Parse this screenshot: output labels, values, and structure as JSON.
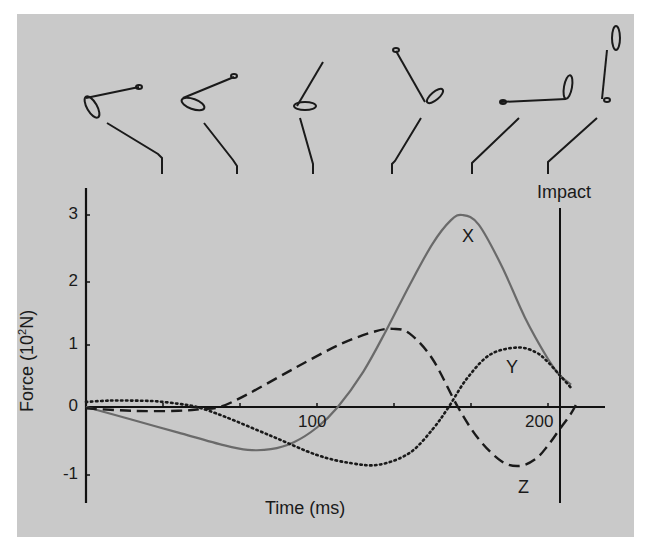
{
  "chart_data": {
    "type": "line",
    "title": "",
    "xlabel": "Time (ms)",
    "ylabel": "Force (10^2 N)",
    "ylabel_parts": {
      "prefix": "Force (10",
      "sup": "2",
      "suffix": "N)"
    },
    "xlim": [
      0,
      225
    ],
    "ylim": [
      -1.4,
      3.4
    ],
    "x_tick_labels": [
      {
        "value": 100,
        "label": "100"
      },
      {
        "value": 200,
        "label": "200"
      }
    ],
    "x_minor_ticks": [
      33,
      67,
      100,
      133,
      167,
      200
    ],
    "y_ticks": [
      {
        "value": 3,
        "label": "3"
      },
      {
        "value": 2,
        "label": "2"
      },
      {
        "value": 1,
        "label": "1"
      },
      {
        "value": 0,
        "label": "0"
      },
      {
        "value": -1,
        "label": "-1"
      }
    ],
    "grid": false,
    "legend": "inline labels",
    "annotations": [
      {
        "text": "Impact",
        "x": 205,
        "type": "vertical-line"
      },
      {
        "text": "X",
        "x": 163,
        "y": 2.7
      },
      {
        "text": "Y",
        "x": 185,
        "y": 0.6
      },
      {
        "text": "Z",
        "x": 188,
        "y": -1.3
      }
    ],
    "series": [
      {
        "name": "X",
        "style": "solid",
        "color": "#6a6a6a",
        "x": [
          0,
          20,
          40,
          60,
          70,
          80,
          90,
          100,
          109,
          120,
          130,
          140,
          150,
          158,
          163,
          170,
          180,
          190,
          200,
          205,
          210
        ],
        "y": [
          0,
          -0.2,
          -0.4,
          -0.6,
          -0.67,
          -0.66,
          -0.55,
          -0.32,
          0,
          0.55,
          1.2,
          1.9,
          2.55,
          2.92,
          3.0,
          2.85,
          2.2,
          1.4,
          0.75,
          0.5,
          0.35
        ]
      },
      {
        "name": "Y",
        "style": "dotted",
        "color": "#1a1a1a",
        "x": [
          0,
          10,
          20,
          30,
          40,
          48,
          60,
          80,
          100,
          115,
          127,
          140,
          150,
          157,
          165,
          175,
          187,
          195,
          200,
          205,
          210
        ],
        "y": [
          0.08,
          0.1,
          0.1,
          0.09,
          0.05,
          0,
          -0.15,
          -0.45,
          -0.75,
          -0.88,
          -0.9,
          -0.72,
          -0.35,
          0,
          0.45,
          0.82,
          0.93,
          0.85,
          0.7,
          0.5,
          0.3
        ]
      },
      {
        "name": "Z",
        "style": "dashed",
        "color": "#1a1a1a",
        "x": [
          0,
          20,
          40,
          50,
          58,
          70,
          90,
          110,
          125,
          133,
          140,
          150,
          161,
          170,
          180,
          188,
          195,
          200,
          205,
          210,
          213
        ],
        "y": [
          -0.02,
          -0.06,
          -0.06,
          -0.03,
          0,
          0.2,
          0.6,
          0.98,
          1.18,
          1.22,
          1.15,
          0.75,
          0,
          -0.5,
          -0.85,
          -0.92,
          -0.8,
          -0.6,
          -0.35,
          -0.1,
          0.1
        ]
      }
    ]
  },
  "labels": {
    "impact": "Impact",
    "series_x": "X",
    "series_y": "Y",
    "series_z": "Z",
    "xlabel": "Time (ms)",
    "ylabel_prefix": "Force (10",
    "ylabel_sup": "2",
    "ylabel_suffix": "N)",
    "tick_100": "100",
    "tick_200": "200",
    "ytick_3": "3",
    "ytick_2": "2",
    "ytick_1": "1",
    "ytick_0": "0",
    "ytick_m1": "-1"
  },
  "colors": {
    "panel_bg": "#c9c9c9",
    "axis": "#111111",
    "series_x": "#6a6a6a",
    "ink": "#1a1a1a"
  },
  "swing_figures": [
    {
      "phase": "address-1"
    },
    {
      "phase": "backswing-2"
    },
    {
      "phase": "backswing-3"
    },
    {
      "phase": "downswing-4"
    },
    {
      "phase": "downswing-5"
    },
    {
      "phase": "impact-6"
    }
  ]
}
